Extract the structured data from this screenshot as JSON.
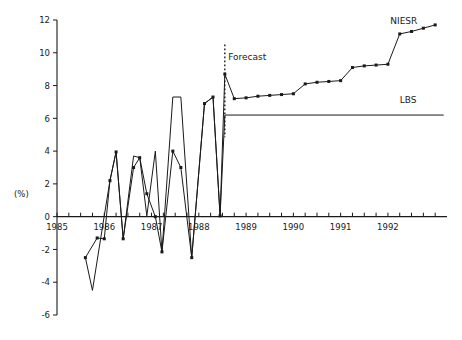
{
  "chart_data": {
    "type": "line",
    "title": "",
    "xlabel": "",
    "ylabel": "(%)",
    "ylim": [
      -6,
      12
    ],
    "xlim": [
      1985.0,
      1993.25
    ],
    "ytick_values": [
      -6,
      -4,
      -2,
      0,
      2,
      4,
      6,
      8,
      10,
      12
    ],
    "ytick_labels": [
      "-6",
      "-4",
      "-2",
      "0",
      "2",
      "4",
      "6",
      "8",
      "10",
      "12"
    ],
    "xtick_values": [
      1985,
      1985.25,
      1985.5,
      1985.75,
      1986,
      1986.25,
      1986.5,
      1986.75,
      1987,
      1987.25,
      1987.5,
      1987.75,
      1988,
      1988.25,
      1988.5,
      1988.75,
      1989,
      1989.25,
      1989.5,
      1989.75,
      1990,
      1990.25,
      1990.5,
      1990.75,
      1991,
      1991.25,
      1991.5,
      1991.75,
      1992,
      1992.25,
      1992.5,
      1992.75,
      1993
    ],
    "xtick_labels": [
      {
        "value": 1985,
        "label": "1985"
      },
      {
        "value": 1986,
        "label": "1986"
      },
      {
        "value": 1987,
        "label": "1987"
      },
      {
        "value": 1988,
        "label": "1988"
      },
      {
        "value": 1989,
        "label": "1989"
      },
      {
        "value": 1990,
        "label": "1990"
      },
      {
        "value": 1991,
        "label": "1991"
      },
      {
        "value": 1992,
        "label": "1992"
      }
    ],
    "grid": false,
    "legend_position": "inline-right",
    "annotations": [
      {
        "name": "forecast-divider-label",
        "text": "Forecast",
        "x": 1988.62,
        "y": 9.55
      },
      {
        "name": "niesr-series-label",
        "text": "NIESR",
        "x": 1992.05,
        "y": 11.75
      },
      {
        "name": "lbs-series-label",
        "text": "LBS",
        "x": 1992.25,
        "y": 6.95
      }
    ],
    "forecast_divider": {
      "x": 1988.55,
      "y_top": 10.5,
      "y_bottom": 4.85
    },
    "series": [
      {
        "name": "NIESR",
        "markers": true,
        "x": [
          1985.6,
          1985.85,
          1986.0,
          1986.12,
          1986.25,
          1986.4,
          1986.62,
          1986.75,
          1986.9,
          1987.08,
          1987.22,
          1987.45,
          1987.62,
          1987.85,
          1988.12,
          1988.3,
          1988.45,
          1988.55,
          1988.75,
          1989.0,
          1989.25,
          1989.5,
          1989.75,
          1990.0,
          1990.25,
          1990.5,
          1990.75,
          1991.0,
          1991.25,
          1991.5,
          1991.75,
          1992.0,
          1992.25,
          1992.5,
          1992.75,
          1993.0
        ],
        "y": [
          -2.5,
          -1.3,
          -1.35,
          2.2,
          3.95,
          -1.35,
          3.0,
          3.6,
          1.4,
          0.0,
          -2.15,
          4.0,
          3.0,
          -2.5,
          6.9,
          7.3,
          0.05,
          8.7,
          7.2,
          7.25,
          7.35,
          7.4,
          7.45,
          7.5,
          8.1,
          8.2,
          8.25,
          8.3,
          9.1,
          9.2,
          9.25,
          9.3,
          11.15,
          11.3,
          11.5,
          11.7
        ]
      },
      {
        "name": "LBS",
        "markers": false,
        "x": [
          1985.6,
          1985.75,
          1986.0,
          1986.12,
          1986.25,
          1986.4,
          1986.62,
          1986.75,
          1986.9,
          1987.08,
          1987.22,
          1987.45,
          1987.62,
          1987.85,
          1988.12,
          1988.3,
          1988.45,
          1988.55,
          1993.18
        ],
        "y": [
          -2.5,
          -4.5,
          0.05,
          2.2,
          3.95,
          -1.35,
          3.7,
          3.6,
          0.05,
          4.0,
          -2.15,
          7.3,
          7.3,
          -2.5,
          6.9,
          7.3,
          0.05,
          6.2,
          6.2
        ]
      }
    ]
  },
  "geometry": {
    "plot_left": 57,
    "plot_right": 447,
    "plot_top": 20,
    "plot_bottom": 315,
    "y_value_top": 12,
    "y_value_bottom": -6,
    "x_value_left": 1985.0,
    "x_value_right": 1993.25,
    "axis_y_zero": 221
  }
}
